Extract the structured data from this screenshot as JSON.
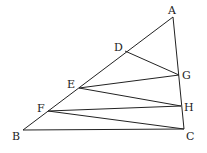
{
  "diagram": {
    "type": "geometry",
    "points": {
      "A": {
        "label": "A",
        "x": 173,
        "y": 17,
        "lx": 168,
        "ly": 14
      },
      "B": {
        "label": "B",
        "x": 23,
        "y": 130,
        "lx": 12,
        "ly": 140
      },
      "C": {
        "label": "C",
        "x": 184,
        "y": 129,
        "lx": 186,
        "ly": 140
      },
      "D": {
        "label": "D",
        "x": 125,
        "y": 51,
        "lx": 114,
        "ly": 51
      },
      "E": {
        "label": "E",
        "x": 79,
        "y": 88,
        "lx": 67,
        "ly": 88
      },
      "F": {
        "label": "F",
        "x": 48,
        "y": 111,
        "lx": 37,
        "ly": 112
      },
      "G": {
        "label": "G",
        "x": 179,
        "y": 75,
        "lx": 182,
        "ly": 79
      },
      "H": {
        "label": "H",
        "x": 181,
        "y": 106,
        "lx": 184,
        "ly": 111
      }
    },
    "segments": [
      [
        "A",
        "B"
      ],
      [
        "A",
        "C"
      ],
      [
        "B",
        "C"
      ],
      [
        "D",
        "G"
      ],
      [
        "G",
        "E"
      ],
      [
        "E",
        "H"
      ],
      [
        "H",
        "F"
      ],
      [
        "F",
        "C"
      ]
    ]
  }
}
